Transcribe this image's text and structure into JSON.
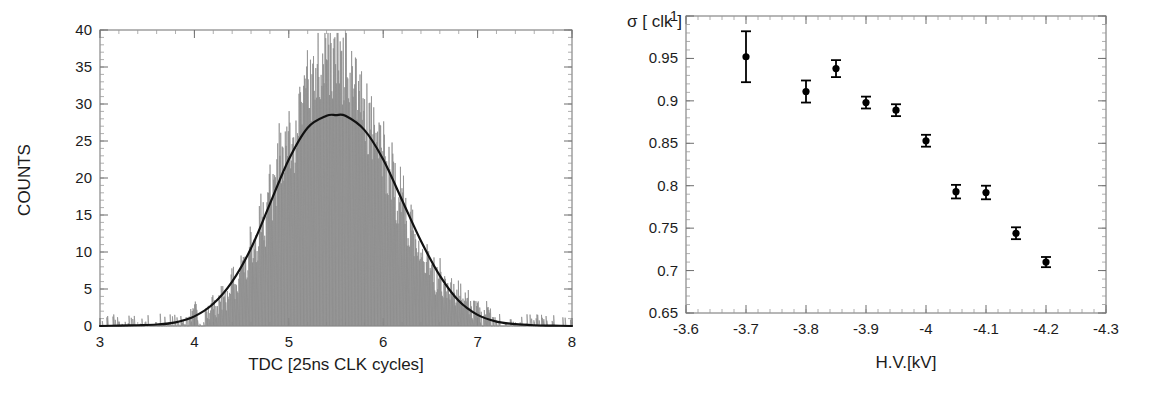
{
  "figure": {
    "background": "#ffffff",
    "panel_count": 2
  },
  "chart_data": [
    {
      "id": "tdc-histogram",
      "type": "line",
      "title": "",
      "xlabel": "TDC [25ns CLK cycles]",
      "ylabel": "COUNTS",
      "xlim": [
        3,
        8
      ],
      "ylim": [
        0,
        40
      ],
      "xticks": [
        3,
        4,
        5,
        6,
        7,
        8
      ],
      "xtick_labels": [
        "3",
        "4",
        "5",
        "6",
        "7",
        "8"
      ],
      "yticks": [
        0,
        5,
        10,
        15,
        20,
        25,
        30,
        35,
        40
      ],
      "ytick_labels": [
        "0",
        "5",
        "10",
        "15",
        "20",
        "25",
        "30",
        "35",
        "40"
      ],
      "x_minor_step": 0.2,
      "y_minor_step": 1,
      "grid": false,
      "legend": "none",
      "series": [
        {
          "name": "measured counts",
          "style": "histogram-noise",
          "color": "#8a8a8a",
          "description": "Noisy per-bin TDC counts histogram peaking near 5.5 cycles at about 38 counts",
          "x": [
            3.0,
            3.05,
            3.1,
            3.15,
            3.2,
            3.25,
            3.3,
            3.35,
            3.4,
            3.45,
            3.5,
            3.55,
            3.6,
            3.65,
            3.7,
            3.75,
            3.8,
            3.85,
            3.9,
            3.95,
            4.0,
            4.05,
            4.1,
            4.15,
            4.2,
            4.25,
            4.3,
            4.35,
            4.4,
            4.45,
            4.5,
            4.55,
            4.6,
            4.65,
            4.7,
            4.75,
            4.8,
            4.85,
            4.9,
            4.95,
            5.0,
            5.05,
            5.1,
            5.15,
            5.2,
            5.25,
            5.3,
            5.35,
            5.4,
            5.45,
            5.5,
            5.55,
            5.6,
            5.65,
            5.7,
            5.75,
            5.8,
            5.85,
            5.9,
            5.95,
            6.0,
            6.05,
            6.1,
            6.15,
            6.2,
            6.25,
            6.3,
            6.35,
            6.4,
            6.45,
            6.5,
            6.55,
            6.6,
            6.65,
            6.7,
            6.75,
            6.8,
            6.85,
            6.9,
            6.95,
            7.0,
            7.05,
            7.1,
            7.15,
            7.2,
            7.25,
            7.3,
            7.35,
            7.4,
            7.45,
            7.5,
            7.55,
            7.6,
            7.65,
            7.7,
            7.75,
            7.8,
            7.85,
            7.9,
            7.95,
            8.0
          ],
          "y": [
            1,
            0,
            1,
            0,
            1,
            1,
            0,
            1,
            0,
            1,
            1,
            0,
            1,
            0,
            1,
            1,
            0,
            1,
            1,
            1,
            2,
            1,
            1,
            2,
            3,
            2,
            4,
            3,
            6,
            5,
            8,
            6,
            11,
            9,
            14,
            12,
            19,
            16,
            23,
            20,
            26,
            22,
            30,
            27,
            33,
            29,
            36,
            32,
            38,
            34,
            37,
            33,
            36,
            31,
            33,
            28,
            30,
            25,
            27,
            22,
            24,
            19,
            21,
            16,
            18,
            13,
            14,
            10,
            12,
            8,
            9,
            6,
            7,
            5,
            5,
            4,
            4,
            3,
            3,
            2,
            2,
            1,
            2,
            1,
            1,
            1,
            0,
            1,
            1,
            0,
            1,
            0,
            1,
            1,
            0,
            1,
            0,
            1,
            1,
            0,
            1
          ]
        },
        {
          "name": "gaussian fit",
          "style": "smooth-line",
          "color": "#111111",
          "description": "Smooth fitted peak with maximum of about 28.5 counts near 5.5 cycles",
          "peak_x": 5.5,
          "peak_y": 28.5,
          "sigma": 0.62,
          "x": [
            3.0,
            3.2,
            3.4,
            3.6,
            3.8,
            4.0,
            4.2,
            4.4,
            4.6,
            4.8,
            5.0,
            5.2,
            5.4,
            5.5,
            5.6,
            5.8,
            6.0,
            6.2,
            6.4,
            6.6,
            6.8,
            7.0,
            7.2,
            7.4,
            7.6,
            7.8,
            8.0
          ],
          "y": [
            0.0,
            0.05,
            0.1,
            0.2,
            0.5,
            1.3,
            3.0,
            6.0,
            10.5,
            16.5,
            22.5,
            26.8,
            28.4,
            28.5,
            28.4,
            26.5,
            22.5,
            17.0,
            11.5,
            6.8,
            3.4,
            1.5,
            0.6,
            0.25,
            0.1,
            0.05,
            0.0
          ]
        }
      ]
    },
    {
      "id": "sigma-vs-hv",
      "type": "scatter",
      "title": "",
      "xlabel": "H.V.[kV]",
      "ylabel": "",
      "corner_label": "σ [ clk ]",
      "xlim": [
        -3.6,
        -4.3
      ],
      "ylim": [
        0.65,
        1.0
      ],
      "x_reversed": true,
      "xticks": [
        -3.6,
        -3.7,
        -3.8,
        -3.9,
        -4.0,
        -4.1,
        -4.2,
        -4.3
      ],
      "xtick_labels": [
        "-3.6",
        "-3.7",
        "-3.8",
        "-3.9",
        "-4",
        "-4.1",
        "-4.2",
        "-4.3"
      ],
      "yticks": [
        0.65,
        0.7,
        0.75,
        0.8,
        0.85,
        0.9,
        0.95,
        1.0
      ],
      "ytick_labels": [
        "0.65",
        "0.7",
        "0.75",
        "0.8",
        "0.85",
        "0.9",
        "0.95",
        "1"
      ],
      "x_minor_step": 0.02,
      "y_minor_step": 0.01,
      "grid": false,
      "legend": "none",
      "series": [
        {
          "name": "sigma measurements",
          "style": "points-with-errorbars",
          "color": "#000000",
          "x": [
            -3.7,
            -3.8,
            -3.85,
            -3.9,
            -3.95,
            -4.0,
            -4.05,
            -4.1,
            -4.15,
            -4.2
          ],
          "y": [
            0.952,
            0.911,
            0.938,
            0.898,
            0.889,
            0.853,
            0.793,
            0.792,
            0.744,
            0.71
          ],
          "yerr": [
            0.03,
            0.013,
            0.01,
            0.007,
            0.007,
            0.007,
            0.008,
            0.008,
            0.007,
            0.006
          ]
        }
      ]
    }
  ]
}
